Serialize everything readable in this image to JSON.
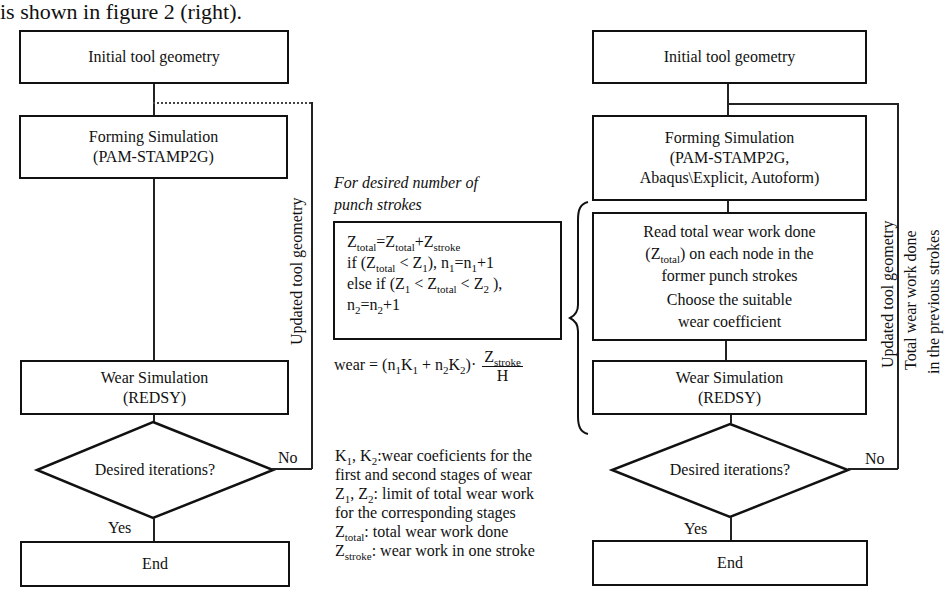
{
  "header_text": "is shown in figure 2 (right).",
  "left_flow": {
    "initial": "Initial tool geometry",
    "forming_l1": "Forming Simulation",
    "forming_l2": "(PAM-STAMP2G)",
    "wear_l1": "Wear Simulation",
    "wear_l2": "(REDSY)",
    "decision": "Desired iterations?",
    "no_label": "No",
    "yes_label": "Yes",
    "end": "End",
    "feedback_label": "Updated tool geometry"
  },
  "middle": {
    "caption_l1": "For desired number of",
    "caption_l2": "punch strokes",
    "box_lines": {
      "l1": {
        "a": "Z",
        "a_sub": "total",
        "b": "=Z",
        "b_sub": "total",
        "c": "+Z",
        "c_sub": "stroke"
      },
      "l2": {
        "pre": "if  (Z",
        "s1": "total",
        "mid": " < Z",
        "s2": "1",
        "post": "),  n",
        "s3": "1",
        "eq": "=n",
        "s4": "1",
        "end": "+1"
      },
      "l3": {
        "pre": "else if  (Z",
        "s1": "1",
        "mid": " < Z",
        "s2": "total",
        "mid2": " < Z",
        "s3": "2",
        "end": " ),"
      },
      "l4": {
        "pre": "n",
        "s1": "2",
        "eq": "=n",
        "s2": "2",
        "end": "+1"
      }
    },
    "wear_formula": {
      "lhs": "wear = (n",
      "s1": "1",
      "k1": "K",
      "s2": "1",
      "plus": " + n",
      "s3": "2",
      "k2": "K",
      "s4": "2",
      "close": ")·",
      "num": "Z",
      "num_sub": "stroke",
      "den": "H"
    },
    "legend": {
      "l1": {
        "a": "K",
        "s1": "1",
        "b": ", K",
        "s2": "2",
        "c": ":wear coeficients for  the"
      },
      "l2": "first and second stages of wear",
      "l3": {
        "a": "Z",
        "s1": "1",
        "b": ", Z",
        "s2": "2",
        "c": ": limit of total wear work"
      },
      "l4": "for the corresponding stages",
      "l5": {
        "a": "Z",
        "s1": "total",
        "c": ":   total wear work done"
      },
      "l6": {
        "a": "Z",
        "s1": "stroke",
        "c": ": wear work in one stroke"
      }
    }
  },
  "right_flow": {
    "initial": "Initial tool geometry",
    "forming_l1": "Forming Simulation",
    "forming_l2": "(PAM-STAMP2G,",
    "forming_l3": "Abaqus\\Explicit, Autoform)",
    "read_l1": "Read total wear work done",
    "read_l2_pre": "(Z",
    "read_l2_sub": "total",
    "read_l2_post": ") on each node in the",
    "read_l3": "former punch strokes",
    "read_l4": "Choose the suitable",
    "read_l5": "wear coefficient",
    "wear_l1": "Wear Simulation",
    "wear_l2": "(REDSY)",
    "decision": "Desired iterations?",
    "no_label": "No",
    "yes_label": "Yes",
    "end": "End",
    "feedback_label_1": "Updated tool geometry",
    "feedback_label_2": "Total wear work done",
    "feedback_label_3": "in the previous strokes"
  }
}
